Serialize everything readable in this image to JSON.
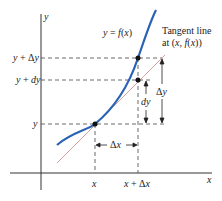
{
  "labels": {
    "y_axis": "y",
    "x_axis": "x",
    "curve": "y = f(x)",
    "tangent_line_1": "Tangent line",
    "tangent_line_2": "at (x, f(x))",
    "y": "y",
    "y_plus_dy": "y + dy",
    "y_plus_delta_y": "y + Δy",
    "x": "x",
    "x_plus_delta_x": "x + Δx",
    "delta_x": "Δx",
    "dy": "dy",
    "delta_y": "Δy"
  },
  "colors": {
    "curve": "#2a62b4",
    "tangent": "#d9a0a0",
    "axes": "#333333",
    "dashes": "#444444"
  }
}
